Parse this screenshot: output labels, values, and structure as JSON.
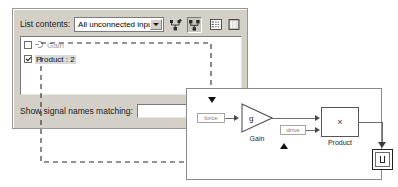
{
  "dialog": {
    "list_contents_label": "List contents:",
    "dropdown": {
      "selected": "All unconnected inputs",
      "options": [
        "All unconnected inputs"
      ],
      "arrow_icon": "chevron-down-icon"
    },
    "toolbar": [
      {
        "name": "expand-hierarchy-icon",
        "title": "",
        "pressed": false
      },
      {
        "name": "collapse-hierarchy-icon",
        "title": "",
        "pressed": true
      },
      {
        "name": "list-view-icon",
        "title": "",
        "pressed": false
      },
      {
        "name": "columns-view-icon",
        "title": "",
        "pressed": false
      }
    ],
    "list_items": [
      {
        "label": "Gain",
        "checked": false,
        "dimmed": true,
        "selected": false,
        "icon": "input-port-icon"
      },
      {
        "label": "Product : 2",
        "checked": true,
        "dimmed": false,
        "selected": true,
        "icon": ""
      }
    ],
    "filter_label": "Show signal names matching:",
    "filter_value": "",
    "filter_placeholder": ""
  },
  "model": {
    "signal_tags": [
      {
        "name": "force-signal-tag",
        "label": "force"
      },
      {
        "name": "drive-signal-tag",
        "label": "drive"
      }
    ],
    "blocks": [
      {
        "name": "gain-block",
        "symbol": "g",
        "label": "Gain"
      },
      {
        "name": "product-block",
        "symbol": "×",
        "label": "Product"
      },
      {
        "name": "scope-block",
        "symbol": "",
        "label": ""
      }
    ]
  },
  "colors": {
    "dialog_face": "#d4d0c8",
    "field_white": "#ffffff",
    "text": "#1b1b1b",
    "dimmed_text": "#9d9d9d",
    "signal_line": "#6e6e6e",
    "dash_line": "#2a2a2a"
  }
}
